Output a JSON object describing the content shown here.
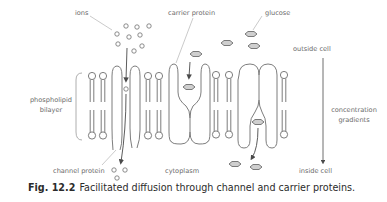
{
  "figure": {
    "caption_number": "Fig. 12.2",
    "caption_text": "Facilitated diffusion through channel and carrier proteins."
  },
  "labels": {
    "ions": "ions",
    "carrier_protein": "carrier protein",
    "glucose": "glucose",
    "outside_cell": "outside cell",
    "phospholipid_line1": "phospholipid",
    "phospholipid_line2": "bilayer",
    "concentration_line1": "concentration",
    "concentration_line2": "gradients",
    "channel_protein": "channel protein",
    "cytoplasm": "cytoplasm",
    "inside_cell": "inside cell"
  },
  "colors": {
    "outline": "#6e6e6e",
    "leader_line": "#bdbdbd",
    "glucose_fill": "#cfcfcf",
    "label_text": "#6b6b6b",
    "caption_text": "#2b2b2b"
  },
  "elements": {
    "ions_outside_count": 9,
    "ions_in_channel_count": 1,
    "ions_inside_count": 3,
    "glucose_outside_count": 4,
    "glucose_in_carrier_count": 2,
    "glucose_inside_count": 2,
    "phospholipid_count": 7,
    "channel_protein_count": 1,
    "carrier_protein_count": 2
  }
}
